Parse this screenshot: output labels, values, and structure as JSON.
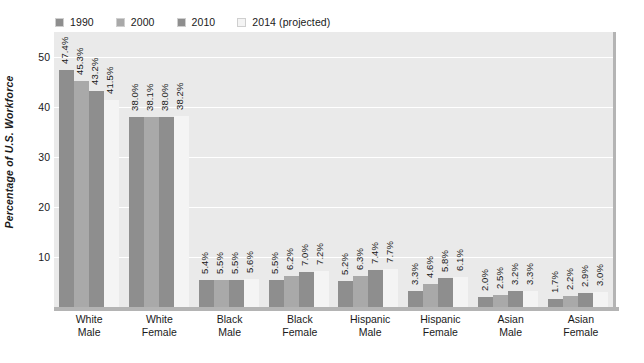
{
  "chart_data": {
    "type": "bar",
    "title": "",
    "subtitle": "",
    "xlabel": "",
    "ylabel": "Percentage of U.S. Workforce",
    "ylim": [
      0,
      55
    ],
    "yticks": [
      10,
      20,
      30,
      40,
      50
    ],
    "grid": true,
    "legend_position": "top-left",
    "value_suffix": "%",
    "categories": [
      "White Male",
      "White Female",
      "Black Male",
      "Black Female",
      "Hispanic Male",
      "Hispanic Female",
      "Asian Male",
      "Asian Female"
    ],
    "category_lines": [
      [
        "White",
        "Male"
      ],
      [
        "White",
        "Female"
      ],
      [
        "Black",
        "Male"
      ],
      [
        "Black",
        "Female"
      ],
      [
        "Hispanic",
        "Male"
      ],
      [
        "Hispanic",
        "Female"
      ],
      [
        "Asian",
        "Male"
      ],
      [
        "Asian",
        "Female"
      ]
    ],
    "series": [
      {
        "name": "1990",
        "color": "#8e8e8e",
        "values": [
          47.4,
          38.0,
          5.4,
          5.5,
          5.2,
          3.3,
          2.0,
          1.7
        ],
        "labels": [
          "47.4%",
          "38.0%",
          "5.4%",
          "5.5%",
          "5.2%",
          "3.3%",
          "2.0%",
          "1.7%"
        ]
      },
      {
        "name": "2000",
        "color": "#a9a9a9",
        "values": [
          45.3,
          38.1,
          5.5,
          6.2,
          6.3,
          4.6,
          2.5,
          2.2
        ],
        "labels": [
          "45.3%",
          "38.1%",
          "5.5%",
          "6.2%",
          "6.3%",
          "4.6%",
          "2.5%",
          "2.2%"
        ]
      },
      {
        "name": "2010",
        "color": "#8e8e8e",
        "values": [
          43.2,
          38.0,
          5.5,
          7.0,
          7.4,
          5.8,
          3.2,
          2.9
        ],
        "labels": [
          "43.2%",
          "38.0%",
          "5.5%",
          "7.0%",
          "7.4%",
          "5.8%",
          "3.2%",
          "2.9%"
        ]
      },
      {
        "name": "2014 (projected)",
        "color": "#f4f4f4",
        "values": [
          41.5,
          38.2,
          5.6,
          7.2,
          7.7,
          6.1,
          3.3,
          3.0
        ],
        "labels": [
          "41.5%",
          "38.2%",
          "5.6%",
          "7.2%",
          "7.7%",
          "6.1%",
          "3.3%",
          "3.0%"
        ]
      }
    ]
  },
  "legend": {
    "items": [
      {
        "label": "1990",
        "color": "#8e8e8e"
      },
      {
        "label": "2000",
        "color": "#a9a9a9"
      },
      {
        "label": "2010",
        "color": "#8e8e8e"
      },
      {
        "label": "2014 (projected)",
        "color": "#f4f4f4"
      }
    ]
  }
}
